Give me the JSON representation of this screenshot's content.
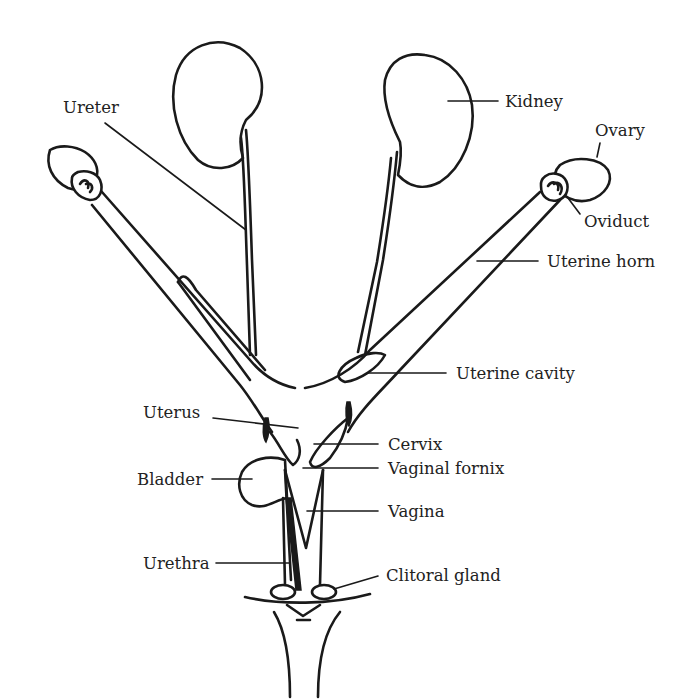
{
  "diagram": {
    "labels": {
      "ureter": "Ureter",
      "kidney": "Kidney",
      "ovary": "Ovary",
      "oviduct": "Oviduct",
      "uterine_horn": "Uterine horn",
      "uterine_cavity": "Uterine cavity",
      "uterus": "Uterus",
      "cervix": "Cervix",
      "vaginal_fornix": "Vaginal fornix",
      "bladder": "Bladder",
      "vagina": "Vagina",
      "urethra": "Urethra",
      "clitoral_gland": "Clitoral gland"
    }
  }
}
